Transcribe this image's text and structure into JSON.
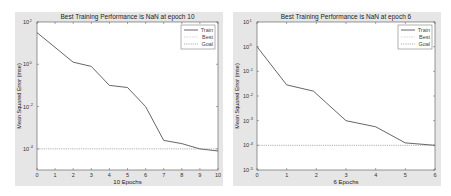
{
  "chart_data": [
    {
      "type": "line",
      "title": "Best Training Performance is NaN at epoch 10",
      "xlabel": "10 Epochs",
      "ylabel": "Mean Squared Error  (mse)",
      "yscale": "log",
      "xlim": [
        0,
        10
      ],
      "ylim_exp": [
        -5,
        2
      ],
      "x_ticks": [
        "0",
        "1",
        "2",
        "3",
        "4",
        "5",
        "6",
        "7",
        "8",
        "9",
        "10"
      ],
      "y_ticks": [
        {
          "base": "10",
          "exp": "2"
        },
        {
          "base": "10",
          "exp": "0"
        },
        {
          "base": "10",
          "exp": "-2"
        },
        {
          "base": "10",
          "exp": "-4"
        }
      ],
      "legend": [
        "Train",
        "Best",
        "Goal"
      ],
      "legend_position": "upper right",
      "series": [
        {
          "name": "Train",
          "x": [
            0,
            2,
            3,
            4,
            5,
            6,
            7,
            8,
            9,
            10
          ],
          "log10_y": [
            1.5,
            0.1,
            -0.1,
            -1.0,
            -1.1,
            -2.0,
            -3.6,
            -3.75,
            -4.0,
            -4.1
          ]
        },
        {
          "name": "Goal",
          "x": [
            0,
            10
          ],
          "log10_y": [
            -4,
            -4
          ]
        }
      ]
    },
    {
      "type": "line",
      "title": "Best Training Performance is NaN at epoch 6",
      "xlabel": "6 Epochs",
      "ylabel": "Mean Squared Error  (mse)",
      "yscale": "log",
      "xlim": [
        0,
        6
      ],
      "ylim_exp": [
        -5,
        1
      ],
      "x_ticks": [
        "0",
        "1",
        "2",
        "3",
        "4",
        "5",
        "6"
      ],
      "y_ticks": [
        {
          "base": "10",
          "exp": "1"
        },
        {
          "base": "10",
          "exp": "0"
        },
        {
          "base": "10",
          "exp": "-1"
        },
        {
          "base": "10",
          "exp": "-2"
        },
        {
          "base": "10",
          "exp": "-3"
        },
        {
          "base": "10",
          "exp": "-4"
        },
        {
          "base": "10",
          "exp": "-5"
        }
      ],
      "legend": [
        "Train",
        "Best",
        "Goal"
      ],
      "legend_position": "upper right",
      "series": [
        {
          "name": "Train",
          "x": [
            0,
            1,
            1.9,
            3,
            4,
            5,
            6
          ],
          "log10_y": [
            0,
            -1.55,
            -1.8,
            -3.0,
            -3.25,
            -3.9,
            -4.0
          ]
        },
        {
          "name": "Goal",
          "x": [
            0,
            6
          ],
          "log10_y": [
            -4,
            -4
          ]
        }
      ]
    }
  ]
}
